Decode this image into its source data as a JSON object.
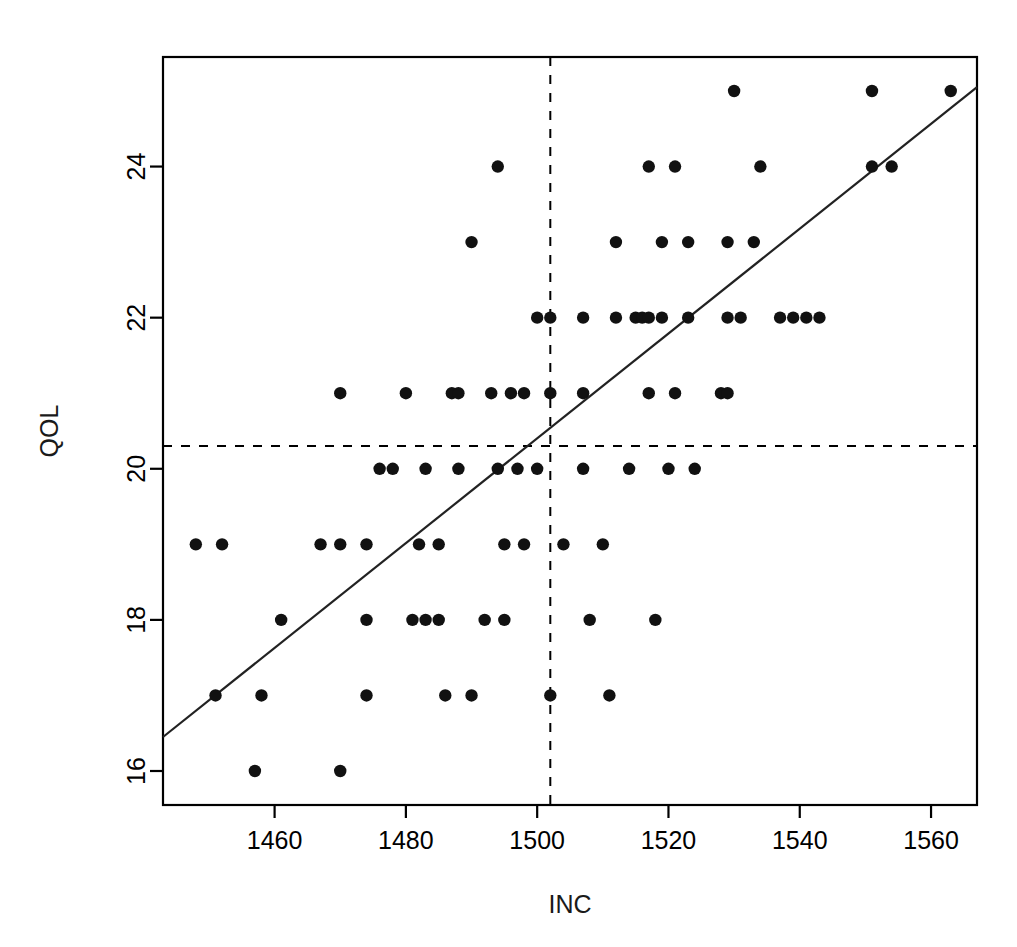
{
  "figure": {
    "background": "#ffffff",
    "foreground": "#000000",
    "point_color": "#111111",
    "line_color": "#222222"
  },
  "chart_data": {
    "type": "scatter",
    "title": "",
    "xlabel": "INC",
    "ylabel": "QOL",
    "xlim": [
      1443,
      1567
    ],
    "ylim": [
      15.55,
      25.45
    ],
    "xticks": [
      1460,
      1480,
      1500,
      1520,
      1540,
      1560
    ],
    "yticks": [
      16,
      18,
      20,
      22,
      24
    ],
    "xticklabels": [
      "1460",
      "1480",
      "1500",
      "1520",
      "1540",
      "1560"
    ],
    "yticklabels": [
      "16",
      "18",
      "20",
      "22",
      "24"
    ],
    "grid": false,
    "legend": null,
    "box": true,
    "annotations": [
      {
        "name": "mean-inc-vline",
        "kind": "vline",
        "x": 1502,
        "style": "dashed"
      },
      {
        "name": "mean-qol-hline",
        "kind": "hline",
        "y": 20.3,
        "style": "dashed"
      }
    ],
    "fit_line": {
      "name": "regression-line",
      "kind": "line",
      "style": "solid",
      "x": [
        1443,
        1567
      ],
      "y": [
        16.45,
        25.05
      ],
      "slope": 0.0694,
      "intercept": -83.7
    },
    "points": [
      {
        "x": 1448,
        "y": 19
      },
      {
        "x": 1452,
        "y": 19
      },
      {
        "x": 1451,
        "y": 17
      },
      {
        "x": 1457,
        "y": 16
      },
      {
        "x": 1458,
        "y": 17
      },
      {
        "x": 1461,
        "y": 18
      },
      {
        "x": 1467,
        "y": 19
      },
      {
        "x": 1470,
        "y": 16
      },
      {
        "x": 1470,
        "y": 21
      },
      {
        "x": 1470,
        "y": 19
      },
      {
        "x": 1474,
        "y": 19
      },
      {
        "x": 1474,
        "y": 18
      },
      {
        "x": 1474,
        "y": 17
      },
      {
        "x": 1476,
        "y": 20
      },
      {
        "x": 1478,
        "y": 20
      },
      {
        "x": 1480,
        "y": 21
      },
      {
        "x": 1481,
        "y": 18
      },
      {
        "x": 1482,
        "y": 19
      },
      {
        "x": 1483,
        "y": 18
      },
      {
        "x": 1483,
        "y": 20
      },
      {
        "x": 1485,
        "y": 18
      },
      {
        "x": 1485,
        "y": 19
      },
      {
        "x": 1486,
        "y": 17
      },
      {
        "x": 1487,
        "y": 21
      },
      {
        "x": 1488,
        "y": 21
      },
      {
        "x": 1488,
        "y": 20
      },
      {
        "x": 1490,
        "y": 23
      },
      {
        "x": 1490,
        "y": 17
      },
      {
        "x": 1492,
        "y": 18
      },
      {
        "x": 1493,
        "y": 21
      },
      {
        "x": 1494,
        "y": 24
      },
      {
        "x": 1494,
        "y": 20
      },
      {
        "x": 1495,
        "y": 19
      },
      {
        "x": 1495,
        "y": 18
      },
      {
        "x": 1496,
        "y": 21
      },
      {
        "x": 1497,
        "y": 20
      },
      {
        "x": 1498,
        "y": 19
      },
      {
        "x": 1498,
        "y": 21
      },
      {
        "x": 1500,
        "y": 22
      },
      {
        "x": 1500,
        "y": 20
      },
      {
        "x": 1502,
        "y": 22
      },
      {
        "x": 1502,
        "y": 21
      },
      {
        "x": 1502,
        "y": 17
      },
      {
        "x": 1504,
        "y": 19
      },
      {
        "x": 1507,
        "y": 22
      },
      {
        "x": 1507,
        "y": 21
      },
      {
        "x": 1507,
        "y": 20
      },
      {
        "x": 1508,
        "y": 18
      },
      {
        "x": 1510,
        "y": 19
      },
      {
        "x": 1511,
        "y": 17
      },
      {
        "x": 1512,
        "y": 23
      },
      {
        "x": 1512,
        "y": 22
      },
      {
        "x": 1514,
        "y": 20
      },
      {
        "x": 1515,
        "y": 22
      },
      {
        "x": 1516,
        "y": 22
      },
      {
        "x": 1517,
        "y": 24
      },
      {
        "x": 1517,
        "y": 22
      },
      {
        "x": 1517,
        "y": 21
      },
      {
        "x": 1518,
        "y": 18
      },
      {
        "x": 1519,
        "y": 23
      },
      {
        "x": 1519,
        "y": 22
      },
      {
        "x": 1520,
        "y": 20
      },
      {
        "x": 1521,
        "y": 24
      },
      {
        "x": 1521,
        "y": 21
      },
      {
        "x": 1523,
        "y": 23
      },
      {
        "x": 1523,
        "y": 22
      },
      {
        "x": 1524,
        "y": 20
      },
      {
        "x": 1528,
        "y": 21
      },
      {
        "x": 1529,
        "y": 23
      },
      {
        "x": 1529,
        "y": 21
      },
      {
        "x": 1529,
        "y": 22
      },
      {
        "x": 1530,
        "y": 25
      },
      {
        "x": 1531,
        "y": 22
      },
      {
        "x": 1533,
        "y": 23
      },
      {
        "x": 1534,
        "y": 24
      },
      {
        "x": 1537,
        "y": 22
      },
      {
        "x": 1539,
        "y": 22
      },
      {
        "x": 1541,
        "y": 22
      },
      {
        "x": 1543,
        "y": 22
      },
      {
        "x": 1551,
        "y": 25
      },
      {
        "x": 1551,
        "y": 24
      },
      {
        "x": 1554,
        "y": 24
      },
      {
        "x": 1563,
        "y": 25
      }
    ]
  }
}
